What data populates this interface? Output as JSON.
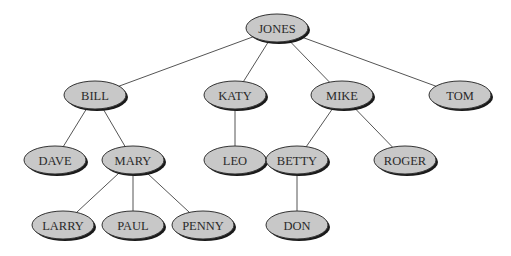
{
  "diagram": {
    "type": "tree",
    "node_style": {
      "fill": "#c8c8c8",
      "stroke": "#333333",
      "shadow": "#1a1a1a",
      "rx": 31,
      "ry": 14
    },
    "edge_color": "#555555",
    "nodes": [
      {
        "id": "jones",
        "label": "JONES",
        "x": 277,
        "y": 28
      },
      {
        "id": "bill",
        "label": "BILL",
        "x": 95,
        "y": 95
      },
      {
        "id": "katy",
        "label": "KATY",
        "x": 235,
        "y": 95
      },
      {
        "id": "mike",
        "label": "MIKE",
        "x": 342,
        "y": 95
      },
      {
        "id": "tom",
        "label": "TOM",
        "x": 460,
        "y": 95
      },
      {
        "id": "dave",
        "label": "DAVE",
        "x": 55,
        "y": 160
      },
      {
        "id": "mary",
        "label": "MARY",
        "x": 133,
        "y": 160
      },
      {
        "id": "leo",
        "label": "LEO",
        "x": 235,
        "y": 160
      },
      {
        "id": "betty",
        "label": "BETTY",
        "x": 297,
        "y": 160
      },
      {
        "id": "roger",
        "label": "ROGER",
        "x": 405,
        "y": 160
      },
      {
        "id": "larry",
        "label": "LARRY",
        "x": 63,
        "y": 225
      },
      {
        "id": "paul",
        "label": "PAUL",
        "x": 133,
        "y": 225
      },
      {
        "id": "penny",
        "label": "PENNY",
        "x": 203,
        "y": 225
      },
      {
        "id": "don",
        "label": "DON",
        "x": 297,
        "y": 225
      }
    ],
    "edges": [
      [
        "jones",
        "bill"
      ],
      [
        "jones",
        "katy"
      ],
      [
        "jones",
        "mike"
      ],
      [
        "jones",
        "tom"
      ],
      [
        "bill",
        "dave"
      ],
      [
        "bill",
        "mary"
      ],
      [
        "katy",
        "leo"
      ],
      [
        "mike",
        "betty"
      ],
      [
        "mike",
        "roger"
      ],
      [
        "mary",
        "larry"
      ],
      [
        "mary",
        "paul"
      ],
      [
        "mary",
        "penny"
      ],
      [
        "betty",
        "don"
      ]
    ]
  }
}
